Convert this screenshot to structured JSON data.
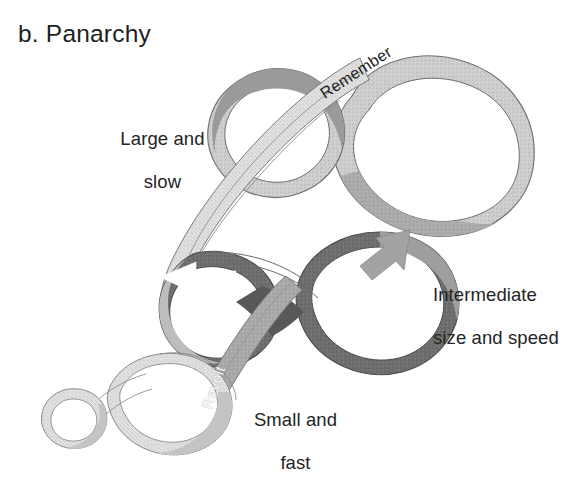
{
  "figure": {
    "title": "b. Panarchy",
    "type": "panarchy-adaptive-cycle-diagram",
    "background_color": "#ffffff",
    "text_color": "#242424"
  },
  "labels": {
    "large_slow_line1": "Large and",
    "large_slow_line2": "slow",
    "intermediate_line1": "Intermediate",
    "intermediate_line2": "size and speed",
    "small_fast_line1": "Small and",
    "small_fast_line2": "fast",
    "remember": "Remember",
    "revolt": "Revolt"
  },
  "loops": [
    {
      "id": "large-slow-loop",
      "name": "Large and slow adaptive cycle",
      "scale": "large",
      "band_color": "#c9c9c9",
      "band_shade_color": "#a8a8a8",
      "outline_color": "#6e6e6e",
      "position": "upper-right"
    },
    {
      "id": "intermediate-loop",
      "name": "Intermediate size and speed adaptive cycle",
      "scale": "intermediate",
      "band_color": "#6f6f6f",
      "band_shade_color": "#8d8d8d",
      "outline_color": "#4a4a4a",
      "position": "center"
    },
    {
      "id": "small-fast-loop",
      "name": "Small and fast adaptive cycle",
      "scale": "small",
      "band_color": "#dcdcdc",
      "band_shade_color": "#c0c0c0",
      "outline_color": "#8a8a8a",
      "position": "lower-left"
    }
  ],
  "connectors": [
    {
      "id": "remember-ribbon",
      "label": "Remember",
      "direction": "from large-slow loop down-left to intermediate loop",
      "band_color": "#dfdfdf",
      "text_color": "#1c1c1c",
      "rotation_deg": -33
    },
    {
      "id": "revolt-ribbon",
      "label": "Revolt",
      "direction": "from small-fast loop up-right to intermediate loop",
      "band_color": "#b8b8b8",
      "text_color": "#ffffff",
      "rotation_deg": -71
    }
  ],
  "arrows": [
    {
      "id": "arrow-left",
      "name": "left-pointing-arrowhead",
      "fill": "#ffffff",
      "on_loop": "intermediate-loop",
      "location": "upper-left lobe"
    },
    {
      "id": "arrow-right",
      "name": "up-right-pointing-arrowhead",
      "fill": "#a3a3a3",
      "on_loop": "intermediate-loop",
      "location": "upper-right lobe"
    }
  ]
}
